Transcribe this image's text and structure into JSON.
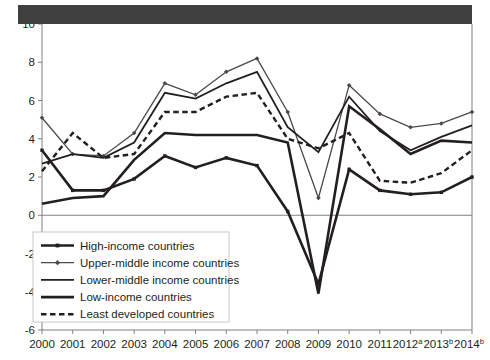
{
  "figure": {
    "header_bar_color": "#3f3f3f",
    "background_color": "#ffffff",
    "axis_color": "#808080",
    "line_color": "#231f20"
  },
  "chart_data": {
    "type": "line",
    "title": "",
    "subtitle": "",
    "xlabel": "",
    "ylabel": "",
    "grid": false,
    "legend_position": "bottom-left",
    "ylim": [
      -6,
      10
    ],
    "yticks": [
      10,
      8,
      6,
      4,
      2,
      0,
      -2,
      -4,
      -6
    ],
    "ytick_labels": [
      "10",
      "8",
      "6",
      "4",
      "2",
      "0",
      "-2",
      "-4",
      "-6"
    ],
    "x": [
      2000,
      2001,
      2002,
      2003,
      2004,
      2005,
      2006,
      2007,
      2008,
      2009,
      2010,
      2011,
      2012,
      2013,
      2014
    ],
    "categories": [
      "2000",
      "2001",
      "2002",
      "2003",
      "2004",
      "2005",
      "2006",
      "2007",
      "2008",
      "2009",
      "2010",
      "2011",
      "2012",
      "2013",
      "2014"
    ],
    "xtick_labels": [
      "2000",
      "2001",
      "2002",
      "2003",
      "2004",
      "2005",
      "2006",
      "2007",
      "2008",
      "2009",
      "2010",
      "2011",
      "2012",
      "2013",
      "2014"
    ],
    "xtick_superscripts": [
      "",
      "",
      "",
      "",
      "",
      "",
      "",
      "",
      "",
      "",
      "",
      "",
      "a",
      "b",
      "b"
    ],
    "series": [
      {
        "name": "High-income countries",
        "style": "solid-marker-square",
        "width": 2.6,
        "marker": "square",
        "values": [
          3.4,
          1.3,
          1.3,
          1.9,
          3.1,
          2.5,
          3.0,
          2.6,
          0.2,
          -3.6,
          2.4,
          1.3,
          1.1,
          1.2,
          2.0
        ]
      },
      {
        "name": "Upper-middle income countries",
        "style": "solid-marker-diamond",
        "width": 1.3,
        "marker": "diamond",
        "values": [
          5.1,
          3.2,
          3.1,
          4.3,
          6.9,
          6.3,
          7.5,
          8.2,
          5.4,
          0.9,
          6.8,
          5.3,
          4.6,
          4.8,
          5.4
        ]
      },
      {
        "name": "Lower-middle income countries",
        "style": "solid",
        "width": 1.8,
        "marker": "none",
        "values": [
          2.7,
          3.2,
          3.0,
          3.8,
          6.4,
          6.1,
          6.9,
          7.5,
          4.6,
          3.3,
          6.2,
          4.4,
          3.4,
          4.1,
          4.7
        ]
      },
      {
        "name": "Low-income countries",
        "style": "solid",
        "width": 2.6,
        "marker": "none",
        "values": [
          0.6,
          0.9,
          1.0,
          2.9,
          4.3,
          4.2,
          4.2,
          4.2,
          3.8,
          -4.1,
          5.7,
          4.5,
          3.2,
          3.9,
          3.8
        ]
      },
      {
        "name": "Least developed countries",
        "style": "dashed",
        "width": 2.4,
        "marker": "none",
        "values": [
          2.3,
          4.3,
          3.0,
          3.2,
          5.4,
          5.4,
          6.2,
          6.4,
          4.0,
          3.5,
          4.3,
          1.8,
          1.7,
          2.2,
          3.4
        ]
      }
    ]
  },
  "legend": {
    "items": [
      {
        "label": "High-income countries"
      },
      {
        "label": "Upper-middle income countries"
      },
      {
        "label": "Lower-middle income countries"
      },
      {
        "label": "Low-income countries"
      },
      {
        "label": "Least developed countries"
      }
    ]
  }
}
